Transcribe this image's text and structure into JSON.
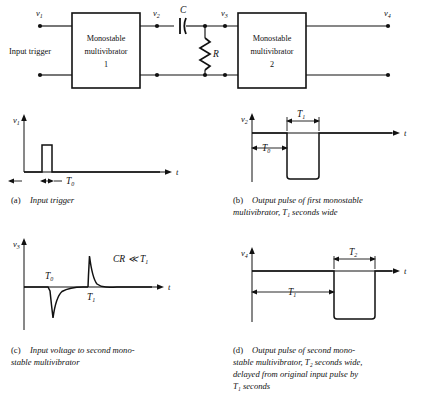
{
  "figure": {
    "type": "circuit-and-waveforms"
  },
  "circuit": {
    "input_label": "Input trigger",
    "nodes": [
      {
        "name": "v1",
        "base": "v",
        "sub": "1"
      },
      {
        "name": "v2",
        "base": "v",
        "sub": "2"
      },
      {
        "name": "v3",
        "base": "v",
        "sub": "3"
      },
      {
        "name": "v4",
        "base": "v",
        "sub": "4"
      }
    ],
    "blocks": [
      {
        "line1": "Monostable",
        "line2": "multivibrator",
        "line3": "1"
      },
      {
        "line1": "Monostable",
        "line2": "multivibrator",
        "line3": "2"
      }
    ],
    "components": [
      {
        "name": "capacitor",
        "label": "C"
      },
      {
        "name": "resistor",
        "label": "R"
      }
    ]
  },
  "panels": [
    {
      "id": "a",
      "tag": "(a)",
      "caption_lines": [
        "Input trigger"
      ],
      "y_label": {
        "base": "v",
        "sub": "1"
      },
      "x_label": "t",
      "dimensions": [
        {
          "base": "T",
          "sub": "0"
        }
      ],
      "waveform": "narrow positive pulse at origin, T0 wide"
    },
    {
      "id": "b",
      "tag": "(b)",
      "caption_lines": [
        "Output pulse of first monostable",
        "multivibrator, T₁ seconds wide"
      ],
      "y_label": {
        "base": "v",
        "sub": "2"
      },
      "x_label": "t",
      "dimensions": [
        {
          "base": "T",
          "sub": "0"
        },
        {
          "base": "T",
          "sub": "1"
        }
      ],
      "waveform": "high level, falls after T0, stays low for T1, returns high"
    },
    {
      "id": "c",
      "tag": "(c)",
      "caption_lines": [
        "Input voltage to second mono-",
        "stable multivibrator"
      ],
      "y_label": {
        "base": "v",
        "sub": "3"
      },
      "x_label": "t",
      "dimensions": [
        {
          "base": "T",
          "sub": "0"
        },
        {
          "base": "T",
          "sub": "1"
        }
      ],
      "annotation": {
        "text": "CR ≪ T",
        "sub": "1"
      },
      "waveform": "differentiated spikes: negative spike at T0, positive spike at T1, exponential decay"
    },
    {
      "id": "d",
      "tag": "(d)",
      "caption_lines": [
        "Output pulse of second mono-",
        "stable multivibrator, T₂ seconds wide,",
        "delayed from original input pulse by",
        "T₁ seconds"
      ],
      "y_label": {
        "base": "v",
        "sub": "4"
      },
      "x_label": "t",
      "dimensions": [
        {
          "base": "T",
          "sub": "1"
        },
        {
          "base": "T",
          "sub": "2"
        }
      ],
      "waveform": "high level for T1, falls low for T2, returns high"
    }
  ],
  "colors": {
    "ink": "#111111",
    "paper": "#ffffff"
  }
}
